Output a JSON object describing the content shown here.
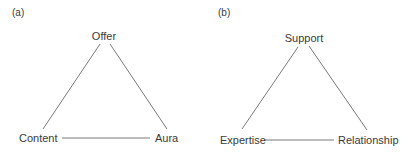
{
  "panels": [
    {
      "label": "(a)",
      "top": "Offer",
      "bottom_left": "Content",
      "bottom_right": "Aura"
    },
    {
      "label": "(b)",
      "top": "Support",
      "bottom_left": "Expertise",
      "bottom_right": "Relationship"
    }
  ],
  "colors": {
    "line": "#6a6a6a",
    "text": "#3a3a3a"
  }
}
